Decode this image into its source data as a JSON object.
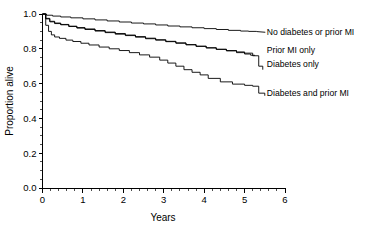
{
  "chart_data": {
    "type": "line",
    "title": "",
    "subtitle": "",
    "xlabel": "Years",
    "ylabel": "Proportion alive",
    "xlim": [
      0,
      6
    ],
    "ylim": [
      0.0,
      1.0
    ],
    "grid": false,
    "legend_position": "right-inline-labels",
    "x_ticks": [
      "0",
      "1",
      "2",
      "3",
      "4",
      "5",
      "6"
    ],
    "x_tick_values": [
      0,
      1,
      2,
      3,
      4,
      5,
      6
    ],
    "x_minor_interval": 0.2,
    "y_ticks": [
      "0.0",
      "0.2",
      "0.4",
      "0.6",
      "0.8",
      "1.0"
    ],
    "y_tick_values": [
      0.0,
      0.2,
      0.4,
      0.6,
      0.8,
      1.0
    ],
    "y_minor_interval": 0.05,
    "line_color": "#000000",
    "background_color": "#ffffff",
    "step_style": "post",
    "series": [
      {
        "name": "No diabetes or prior MI",
        "label": "No diabetes or prior MI",
        "end_value": 0.9,
        "x": [
          0.0,
          0.1,
          0.25,
          0.45,
          0.7,
          1.0,
          1.3,
          1.6,
          1.9,
          2.2,
          2.5,
          2.8,
          3.1,
          3.4,
          3.7,
          4.0,
          4.3,
          4.6,
          4.9,
          5.1,
          5.3
        ],
        "values": [
          1.0,
          0.993,
          0.988,
          0.983,
          0.978,
          0.972,
          0.966,
          0.96,
          0.954,
          0.948,
          0.943,
          0.937,
          0.931,
          0.926,
          0.921,
          0.916,
          0.911,
          0.906,
          0.902,
          0.9,
          0.899
        ]
      },
      {
        "name": "Prior MI only",
        "label": "Prior MI only",
        "end_value": 0.76,
        "x": [
          0.0,
          0.08,
          0.18,
          0.3,
          0.45,
          0.65,
          0.85,
          1.05,
          1.3,
          1.55,
          1.8,
          2.05,
          2.3,
          2.55,
          2.8,
          3.05,
          3.3,
          3.55,
          3.8,
          4.05,
          4.3,
          4.55,
          4.8,
          5.0,
          5.15,
          5.25
        ],
        "values": [
          1.0,
          0.975,
          0.958,
          0.948,
          0.94,
          0.93,
          0.922,
          0.914,
          0.905,
          0.896,
          0.888,
          0.879,
          0.87,
          0.861,
          0.852,
          0.843,
          0.834,
          0.824,
          0.815,
          0.806,
          0.797,
          0.788,
          0.778,
          0.77,
          0.763,
          0.76
        ]
      },
      {
        "name": "Diabetes only",
        "label": "Diabetes only",
        "end_value": 0.68,
        "x": [
          0.0,
          0.08,
          0.18,
          0.3,
          0.45,
          0.65,
          0.85,
          1.05,
          1.3,
          1.55,
          1.8,
          2.05,
          2.3,
          2.55,
          2.8,
          3.05,
          3.3,
          3.55,
          3.8,
          4.05,
          4.3,
          4.55,
          4.8,
          5.0,
          5.2,
          5.35,
          5.45
        ],
        "values": [
          1.0,
          0.972,
          0.955,
          0.945,
          0.938,
          0.928,
          0.919,
          0.911,
          0.902,
          0.893,
          0.884,
          0.876,
          0.867,
          0.858,
          0.85,
          0.841,
          0.832,
          0.823,
          0.814,
          0.805,
          0.797,
          0.79,
          0.782,
          0.775,
          0.76,
          0.7,
          0.68
        ]
      },
      {
        "name": "Diabetes and prior MI",
        "label": "Diabetes and prior MI",
        "end_value": 0.53,
        "x": [
          0.0,
          0.08,
          0.15,
          0.22,
          0.3,
          0.42,
          0.58,
          0.75,
          0.95,
          1.15,
          1.4,
          1.65,
          1.9,
          2.15,
          2.4,
          2.65,
          2.9,
          3.1,
          3.3,
          3.5,
          3.7,
          3.9,
          4.1,
          4.4,
          4.7,
          5.0,
          5.2,
          5.35,
          5.5
        ],
        "values": [
          1.0,
          0.935,
          0.9,
          0.88,
          0.868,
          0.86,
          0.85,
          0.842,
          0.832,
          0.822,
          0.81,
          0.8,
          0.79,
          0.778,
          0.765,
          0.752,
          0.735,
          0.718,
          0.7,
          0.68,
          0.665,
          0.65,
          0.63,
          0.61,
          0.597,
          0.59,
          0.585,
          0.545,
          0.53
        ]
      }
    ],
    "annotations": [
      {
        "text": "No diabetes or prior MI",
        "x": 5.55,
        "y": 0.895
      },
      {
        "text": "Prior MI only",
        "x": 5.55,
        "y": 0.795
      },
      {
        "text": "Diabetes only",
        "x": 5.55,
        "y": 0.715
      },
      {
        "text": "Diabetes and prior MI",
        "x": 5.55,
        "y": 0.545
      }
    ]
  },
  "figure": {
    "xlabel": "Years",
    "ylabel": "Proportion alive",
    "x_tick_labels": [
      "0",
      "1",
      "2",
      "3",
      "4",
      "5",
      "6"
    ],
    "y_tick_labels": [
      "0.0",
      "0.2",
      "0.4",
      "0.6",
      "0.8",
      "1.0"
    ],
    "series_labels": {
      "no_diabetes_no_mi": "No diabetes or prior MI",
      "prior_mi_only": "Prior MI only",
      "diabetes_only": "Diabetes only",
      "diabetes_and_prior_mi": "Diabetes and prior MI"
    }
  }
}
